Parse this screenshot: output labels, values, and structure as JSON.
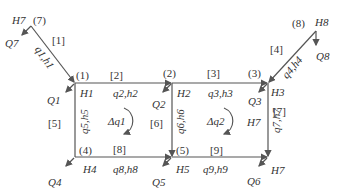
{
  "diagram": {
    "type": "pipe-network",
    "line_color": "#555555",
    "nodes": [
      {
        "id": "(1)",
        "head": "H1",
        "outflow": "Q1"
      },
      {
        "id": "(2)",
        "head": "H2",
        "outflow": "Q2"
      },
      {
        "id": "(3)",
        "head": "H3",
        "outflow": "Q3"
      },
      {
        "id": "(4)",
        "head": "H4",
        "outflow": "Q4"
      },
      {
        "id": "(5)",
        "head": "H5",
        "outflow": "Q5"
      },
      {
        "id": "(6)",
        "head": "H7",
        "outflow": "Q6"
      },
      {
        "id": "(7)",
        "head": "H7",
        "outflow": "Q7"
      },
      {
        "id": "(8)",
        "head": "H8",
        "outflow": "Q8"
      }
    ],
    "pipes": [
      {
        "id": "[1]",
        "label": "q1,h1"
      },
      {
        "id": "[2]",
        "label": "q2,h2"
      },
      {
        "id": "[3]",
        "label": "q3,h3"
      },
      {
        "id": "[4]",
        "label": "q4,h4"
      },
      {
        "id": "[5]",
        "label": "q5,h5"
      },
      {
        "id": "[6]",
        "label": "q6,h6"
      },
      {
        "id": "[7]",
        "label": "q7,h7"
      },
      {
        "id": "[8]",
        "label": "q8,h8"
      },
      {
        "id": "[9]",
        "label": "q9,h9"
      }
    ],
    "loops": [
      {
        "label": "Δq1"
      },
      {
        "label": "Δq2"
      }
    ],
    "extra_labels": {
      "h7_inner": "H7"
    }
  }
}
